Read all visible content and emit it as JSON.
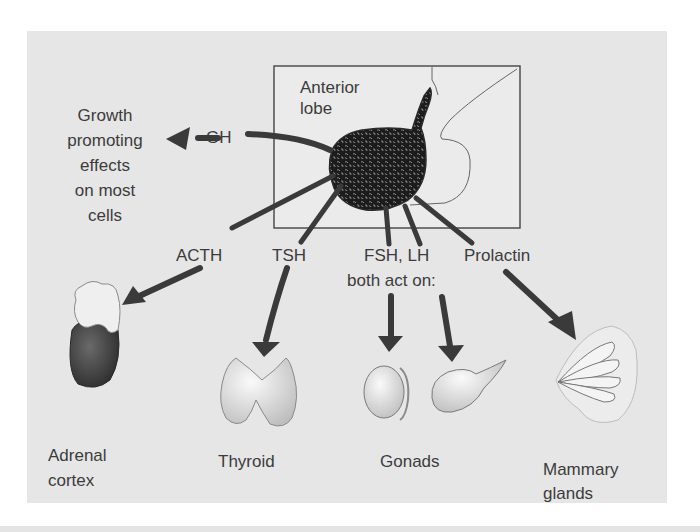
{
  "figure": {
    "type": "diagram",
    "colors": {
      "panel_background": "#e6e6e6",
      "arrow": "#3a3a3a",
      "text": "#3c3c3c",
      "pituitary": "#1e1e1e"
    }
  },
  "source": {
    "label_line1": "Anterior",
    "label_line2": "lobe"
  },
  "effects": {
    "gh_effect_lines": [
      "Growth",
      "promoting",
      "effects",
      "on most",
      "cells"
    ]
  },
  "hormones": {
    "gh": "GH",
    "acth": "ACTH",
    "tsh": "TSH",
    "fsh_lh_line1": "FSH, LH",
    "fsh_lh_line2": "both act on:",
    "prolactin": "Prolactin"
  },
  "targets": {
    "adrenal_line1": "Adrenal",
    "adrenal_line2": "cortex",
    "thyroid": "Thyroid",
    "gonads": "Gonads",
    "mammary_line1": "Mammary",
    "mammary_line2": "glands"
  },
  "relationships": [
    {
      "hormone": "GH",
      "target": "Growth promoting effects on most cells"
    },
    {
      "hormone": "ACTH",
      "target": "Adrenal cortex"
    },
    {
      "hormone": "TSH",
      "target": "Thyroid"
    },
    {
      "hormone": "FSH, LH",
      "target": "Gonads"
    },
    {
      "hormone": "Prolactin",
      "target": "Mammary glands"
    }
  ]
}
